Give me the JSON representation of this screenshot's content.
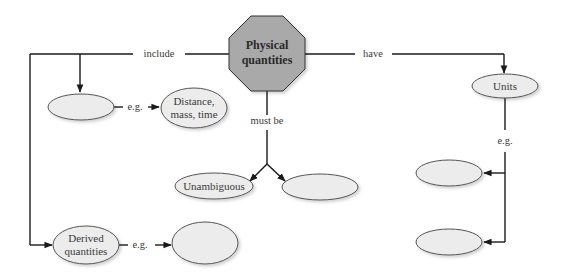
{
  "diagram": {
    "central_node": {
      "label_line1": "Physical",
      "label_line2": "quantities"
    },
    "edges": {
      "include": "include",
      "have": "have",
      "must_be": "must be",
      "eg_base": "e.g.",
      "eg_units": "e.g.",
      "eg_derived": "e.g."
    },
    "nodes": {
      "base_quantities": {
        "label": ""
      },
      "base_examples": {
        "label_line1": "Distance,",
        "label_line2": "mass, time"
      },
      "unambiguous": {
        "label": "Unambiguous"
      },
      "must_be_blank": {
        "label": ""
      },
      "units": {
        "label": "Units"
      },
      "units_example_1": {
        "label": ""
      },
      "units_example_2": {
        "label": ""
      },
      "derived_quantities": {
        "label_line1": "Derived",
        "label_line2": "quantities"
      },
      "derived_examples": {
        "label": ""
      }
    },
    "colors": {
      "octagon_fill": "#a9a9a9",
      "ellipse_fill": "#ececec",
      "line": "#1a1a1a"
    }
  }
}
